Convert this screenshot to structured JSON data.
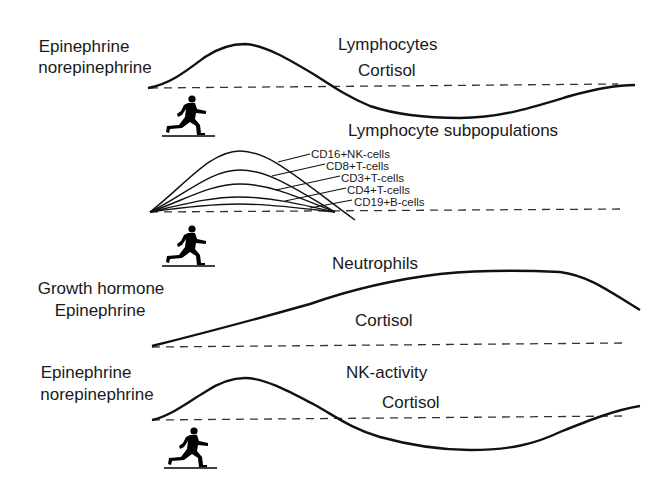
{
  "panels": [
    {
      "left_labels": [
        "Epinephrine",
        "norepinephrine"
      ],
      "right_labels": [
        "Lymphocytes",
        "Cortisol"
      ]
    },
    {
      "title": "Lymphocyte subpopulations",
      "subpopulations": [
        "CD16+NK-cells",
        "CD8+T-cells",
        "CD3+T-cells",
        "CD4+T-cells",
        "CD19+B-cells"
      ]
    },
    {
      "left_labels": [
        "Growth hormone",
        "Epinephrine"
      ],
      "right_labels": [
        "Neutrophils",
        "Cortisol"
      ]
    },
    {
      "left_labels": [
        "Epinephrine",
        "norepinephrine"
      ],
      "right_labels": [
        "NK-activity",
        "Cortisol"
      ]
    }
  ],
  "icons": {
    "runner": "running-person-icon"
  },
  "colors": {
    "line": "#111111",
    "text": "#1a1a1a",
    "background": "#ffffff"
  }
}
